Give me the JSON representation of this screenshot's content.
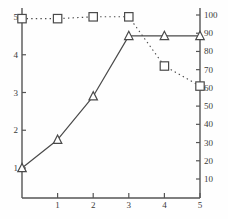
{
  "chart_data": {
    "type": "line",
    "title": "",
    "subtitle": "",
    "xlabel": "",
    "ylabel": "",
    "y2label": "",
    "grid": false,
    "legend": "none",
    "xlim": [
      0,
      5
    ],
    "ylim": [
      0,
      5
    ],
    "y2lim": [
      0,
      100
    ],
    "xticks": [
      "1",
      "2",
      "3",
      "4",
      "5"
    ],
    "xtick_values": [
      1,
      2,
      3,
      4,
      5
    ],
    "yticks": [
      "1",
      "2",
      "3",
      "4",
      "5"
    ],
    "ytick_values": [
      1,
      2,
      3,
      4,
      5
    ],
    "y2ticks": [
      "10",
      "20",
      "30",
      "40",
      "50",
      "60",
      "70",
      "80",
      "90",
      "100"
    ],
    "y2tick_values": [
      10,
      20,
      30,
      40,
      50,
      60,
      70,
      80,
      90,
      100
    ],
    "series": [
      {
        "name": "triangle-series",
        "marker": "triangle-open",
        "linestyle": "solid",
        "axis": "left",
        "color": "#4a4a4a",
        "x": [
          0,
          1,
          2,
          3,
          4,
          5
        ],
        "values": [
          1.0,
          1.75,
          2.9,
          4.5,
          4.5,
          4.5
        ]
      },
      {
        "name": "square-series",
        "marker": "square-open",
        "linestyle": "dotted",
        "axis": "right",
        "color": "#4a4a4a",
        "x": [
          0,
          1,
          2,
          3,
          4,
          5
        ],
        "values": [
          98,
          98,
          99,
          99,
          72,
          61
        ]
      }
    ]
  },
  "colors": {
    "ink": "#4a4a4a",
    "axis": "#555555",
    "background": "#fefefe"
  }
}
